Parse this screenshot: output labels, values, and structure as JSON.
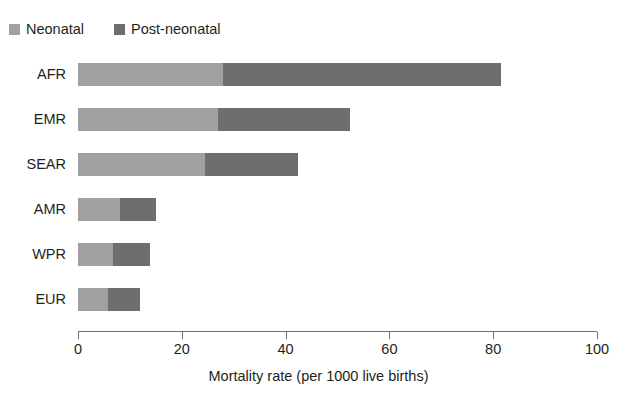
{
  "chart_data": {
    "type": "bar",
    "orientation": "horizontal",
    "stacked": true,
    "title": "",
    "categories": [
      "AFR",
      "EMR",
      "SEAR",
      "AMR",
      "WPR",
      "EUR"
    ],
    "series": [
      {
        "name": "Neonatal",
        "color": "#a0a0a0",
        "values": [
          28.0,
          27.0,
          24.5,
          8.1,
          6.8,
          5.8
        ]
      },
      {
        "name": "Post-neonatal",
        "color": "#6e6e6e",
        "values": [
          53.5,
          25.4,
          17.9,
          6.9,
          7.1,
          6.2
        ]
      }
    ],
    "totals": [
      81.5,
      52.4,
      42.4,
      15.0,
      13.9,
      12.0
    ],
    "xlabel": "Mortality rate (per 1000 live births)",
    "ylabel": "",
    "xlim": [
      0,
      100
    ],
    "xticks": [
      0,
      20,
      40,
      60,
      80,
      100
    ],
    "xtick_labels": [
      "0",
      "20",
      "40",
      "60",
      "80",
      "100"
    ],
    "grid": false,
    "legend_position": "top-left"
  },
  "legend": {
    "items": [
      {
        "label": "Neonatal",
        "color": "#a0a0a0"
      },
      {
        "label": "Post-neonatal",
        "color": "#6e6e6e"
      }
    ]
  },
  "axis": {
    "x_title": "Mortality rate (per 1000 live births)"
  },
  "title": {
    "text": ""
  }
}
